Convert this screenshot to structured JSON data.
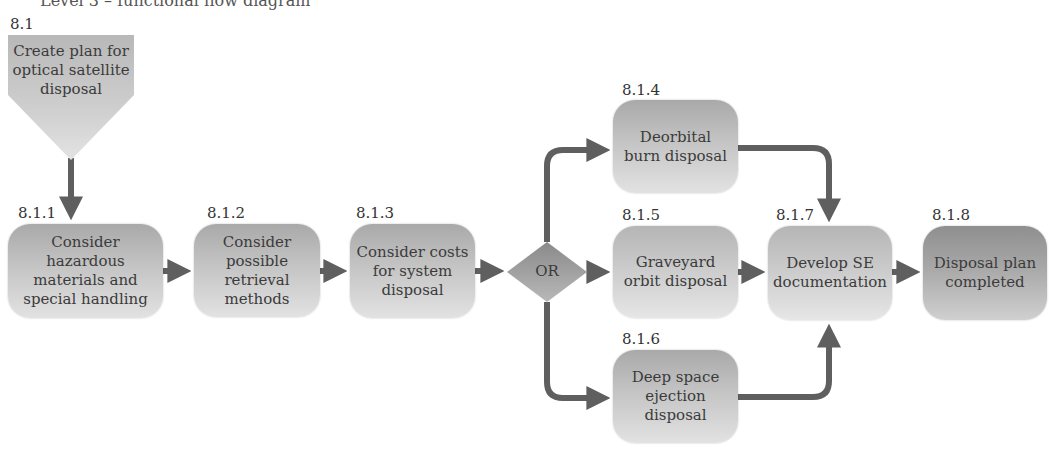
{
  "diagram_title": "Level 3 – functional flow diagram",
  "colors": {
    "arrow": "#5f5f5f",
    "box_light": "#d8d8d8",
    "box_dark": "#9a9a9a",
    "text": "#3b3b3b"
  },
  "start": {
    "id": "8.1",
    "label": "Create plan for optical satellite disposal"
  },
  "nodes": [
    {
      "id": "8.1.1",
      "label": "Consider hazardous materials and special handling"
    },
    {
      "id": "8.1.2",
      "label": "Consider possible retrieval methods"
    },
    {
      "id": "8.1.3",
      "label": "Consider costs for system disposal"
    },
    {
      "id": "8.1.4",
      "label": "Deorbital burn disposal"
    },
    {
      "id": "8.1.5",
      "label": "Graveyard orbit disposal"
    },
    {
      "id": "8.1.6",
      "label": "Deep space ejection disposal"
    },
    {
      "id": "8.1.7",
      "label": "Develop SE documentation"
    },
    {
      "id": "8.1.8",
      "label": "Disposal plan completed"
    }
  ],
  "gate": {
    "label": "OR"
  },
  "edges": [
    [
      "8.1",
      "8.1.1"
    ],
    [
      "8.1.1",
      "8.1.2"
    ],
    [
      "8.1.2",
      "8.1.3"
    ],
    [
      "8.1.3",
      "OR"
    ],
    [
      "OR",
      "8.1.4"
    ],
    [
      "OR",
      "8.1.5"
    ],
    [
      "OR",
      "8.1.6"
    ],
    [
      "8.1.4",
      "8.1.7"
    ],
    [
      "8.1.5",
      "8.1.7"
    ],
    [
      "8.1.6",
      "8.1.7"
    ],
    [
      "8.1.7",
      "8.1.8"
    ]
  ]
}
